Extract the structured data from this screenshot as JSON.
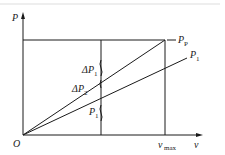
{
  "diagram": {
    "type": "power-velocity line diagram",
    "axes": {
      "y_label": "P",
      "x_label": "v",
      "origin_label": "O",
      "x_marker": {
        "main": "v",
        "sub": "max"
      }
    },
    "lines": [
      {
        "name": "Pp",
        "label_main": "P",
        "label_sub": "P",
        "description": "upper line from origin to top-right corner at v_max"
      },
      {
        "name": "P1",
        "label_main": "P",
        "label_sub": "1",
        "description": "lower line from origin"
      }
    ],
    "annotations": {
      "delta_p1": {
        "prefix": "Δ",
        "main": "P",
        "sub": "1"
      },
      "delta_p2": {
        "prefix": "Δ",
        "main": "P",
        "sub": "2"
      },
      "p1": {
        "main": "P",
        "sub": "1"
      }
    },
    "colors": {
      "ink": "#1a1a1a",
      "top_rule": "#dddddd",
      "background": "#ffffff"
    }
  }
}
